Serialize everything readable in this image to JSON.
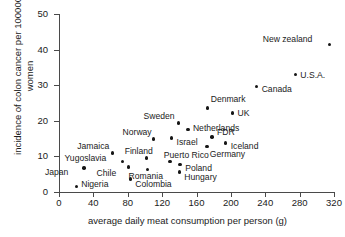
{
  "chart_data": {
    "type": "scatter",
    "title": "",
    "xlabel": "average daily meat consumption per person (g)",
    "ylabel": "incidence of colon cancer per 100000 women",
    "xlim": [
      0,
      320
    ],
    "ylim": [
      0,
      50
    ],
    "xticks": [
      0,
      40,
      80,
      120,
      160,
      200,
      240,
      280,
      320
    ],
    "yticks": [
      0,
      10,
      20,
      30,
      40,
      50
    ],
    "grid": false,
    "legend": false,
    "marker_color": "#161616",
    "axis_color": "#4a4a4a",
    "points": [
      {
        "label": "Nigeria",
        "x": 20,
        "y": 1.5,
        "label_dx": 5,
        "label_dy": -3
      },
      {
        "label": "Japan",
        "x": 29,
        "y": 6.7,
        "label_dx": -39,
        "label_dy": 4
      },
      {
        "label": "Yugoslavia",
        "x": 74,
        "y": 8.6,
        "label_dx": -58,
        "label_dy": -3
      },
      {
        "label": "Chile",
        "x": 81,
        "y": 7.0,
        "label_dx": -32,
        "label_dy": 6
      },
      {
        "label": "Colombia",
        "x": 83,
        "y": 3.7,
        "label_dx": 5,
        "label_dy": 5
      },
      {
        "label": "Jamaica",
        "x": 62,
        "y": 11.0,
        "label_dx": -35,
        "label_dy": -7
      },
      {
        "label": "Romania",
        "x": 103,
        "y": 6.4,
        "label_dx": -19,
        "label_dy": 7
      },
      {
        "label": "Finland",
        "x": 102,
        "y": 9.6,
        "label_dx": -22,
        "label_dy": -7
      },
      {
        "label": "Norway",
        "x": 110,
        "y": 14.9,
        "label_dx": -31,
        "label_dy": -7
      },
      {
        "label": "Puerto Rico",
        "x": 129,
        "y": 8.5,
        "label_dx": -6,
        "label_dy": -7
      },
      {
        "label": "Poland",
        "x": 141,
        "y": 7.7,
        "label_dx": 5,
        "label_dy": 3
      },
      {
        "label": "Hungary",
        "x": 140,
        "y": 5.6,
        "label_dx": 5,
        "label_dy": 5
      },
      {
        "label": "Israel",
        "x": 131,
        "y": 15.2,
        "label_dx": 5,
        "label_dy": 4
      },
      {
        "label": "Sweden",
        "x": 139,
        "y": 19.4,
        "label_dx": -35,
        "label_dy": -7
      },
      {
        "label": "Netherlands",
        "x": 150,
        "y": 17.6,
        "label_dx": 5,
        "label_dy": -1
      },
      {
        "label": "FDR",
        "x": 178,
        "y": 15.5,
        "label_dx": 5,
        "label_dy": -5
      },
      {
        "label": "Germany",
        "x": 172,
        "y": 12.8,
        "label_dx": 3,
        "label_dy": 8
      },
      {
        "label": "Iceland",
        "x": 194,
        "y": 13.8,
        "label_dx": 5,
        "label_dy": 3
      },
      {
        "label": "Denmark",
        "x": 173,
        "y": 23.6,
        "label_dx": 3,
        "label_dy": -9
      },
      {
        "label": "UK",
        "x": 202,
        "y": 22.2,
        "label_dx": 5,
        "label_dy": 0
      },
      {
        "label": "Canada",
        "x": 230,
        "y": 29.7,
        "label_dx": 5,
        "label_dy": 3
      },
      {
        "label": "U.S.A.",
        "x": 275,
        "y": 33.0,
        "label_dx": 5,
        "label_dy": 0
      },
      {
        "label": "New zealand",
        "x": 315,
        "y": 41.4,
        "label_dx": -67,
        "label_dy": -6
      }
    ]
  }
}
